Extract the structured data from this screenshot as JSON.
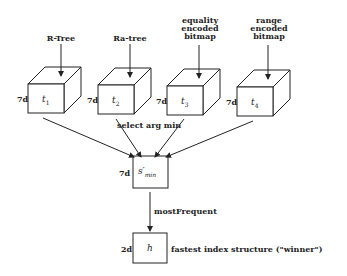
{
  "inputs": [
    {
      "label": "R-Tree",
      "var": "t",
      "sub": "1",
      "dim": "7d"
    },
    {
      "label": "Ra-tree",
      "var": "t",
      "sub": "2",
      "dim": "7d"
    },
    {
      "label": "equality\nencoded\nbitmap",
      "var": "t",
      "sub": "3",
      "dim": "7d"
    },
    {
      "label": "range\nencoded\nbitmap",
      "var": "t",
      "sub": "4",
      "dim": "7d"
    }
  ],
  "select_label": "select arg min",
  "min_node": {
    "var": "s′",
    "sub": "min",
    "dim": "7d"
  },
  "edge_label": "mostFrequent",
  "output_node": {
    "var": "h",
    "dim": "2d",
    "caption": "fastest index structure (\"winner\")"
  }
}
